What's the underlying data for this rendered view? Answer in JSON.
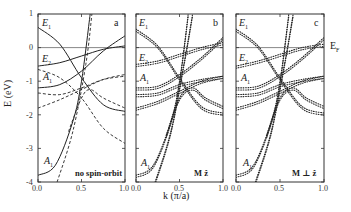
{
  "figure": {
    "y_axis_label": "E (eV)",
    "x_axis_label": "k (π/a)",
    "fermi_label": "E",
    "fermi_sub": "F",
    "y_ticks": [
      "1",
      "0",
      "-1",
      "-2",
      "-3",
      "-4"
    ],
    "x_ticks": [
      "0.0",
      "0.5",
      "1.0"
    ],
    "panels": [
      {
        "letter": "a",
        "note": "no spin-orbit",
        "labels": [
          {
            "t": "E",
            "s": "1"
          },
          {
            "t": "E",
            "s": "2"
          },
          {
            "t": "A",
            "s": "1"
          },
          {
            "t": "A",
            "s": "1"
          }
        ]
      },
      {
        "letter": "b",
        "note": "M  ẑ",
        "labels": [
          {
            "t": "E",
            "s": "1"
          },
          {
            "t": "E",
            "s": "2"
          },
          {
            "t": "A",
            "s": "1"
          },
          {
            "t": "A",
            "s": "1"
          }
        ]
      },
      {
        "letter": "c",
        "note": "M ⊥ ẑ",
        "labels": [
          {
            "t": "E",
            "s": "1"
          },
          {
            "t": "E",
            "s": "2"
          },
          {
            "t": "A",
            "s": "1"
          },
          {
            "t": "A",
            "s": "1"
          }
        ]
      }
    ]
  },
  "chart_data": [
    {
      "type": "line",
      "title": "a",
      "annotation": "no spin-orbit",
      "xlabel": "k (π/a)",
      "ylabel": "E (eV)",
      "xlim": [
        0.0,
        1.0
      ],
      "ylim": [
        -4,
        1
      ],
      "x_ticks": [
        0.0,
        0.5,
        1.0
      ],
      "y_ticks": [
        1,
        0,
        -1,
        -2,
        -3,
        -4
      ],
      "reference_line": {
        "y": 0,
        "label": "E_F"
      },
      "band_labels": [
        "E1",
        "E2",
        "A1",
        "A1"
      ],
      "series": [
        {
          "name": "E1 (solid)",
          "style": "solid",
          "x": [
            0,
            0.25,
            0.5,
            0.75,
            1.0
          ],
          "y": [
            0.6,
            0.1,
            -0.9,
            -1.7,
            -1.9
          ]
        },
        {
          "name": "E2 (solid)",
          "style": "solid",
          "x": [
            0,
            0.25,
            0.5,
            0.75,
            1.0
          ],
          "y": [
            -0.55,
            -0.45,
            -0.25,
            -0.05,
            0.05
          ]
        },
        {
          "name": "A1 upper (solid)",
          "style": "solid",
          "x": [
            0,
            0.25,
            0.5,
            0.75,
            1.0
          ],
          "y": [
            -1.2,
            -1.1,
            -0.7,
            -0.1,
            0.35
          ]
        },
        {
          "name": "A1 lower (solid)",
          "style": "solid",
          "x": [
            0,
            0.2,
            0.4,
            0.5,
            0.6
          ],
          "y": [
            -3.8,
            -3.5,
            -2.2,
            -1.0,
            1.0
          ]
        },
        {
          "name": "dashed 1",
          "style": "dashed",
          "x": [
            0,
            0.25,
            0.5,
            0.75,
            1.0
          ],
          "y": [
            -0.65,
            -0.9,
            -1.5,
            -2.4,
            -2.85
          ]
        },
        {
          "name": "dashed 2",
          "style": "dashed",
          "x": [
            0,
            0.25,
            0.5,
            0.75,
            1.0
          ],
          "y": [
            -1.35,
            -1.4,
            -1.2,
            -0.95,
            -0.85
          ]
        },
        {
          "name": "dashed 3",
          "style": "dashed",
          "x": [
            0,
            0.25,
            0.5,
            0.75,
            1.0
          ],
          "y": [
            -1.8,
            -1.55,
            -1.25,
            -0.95,
            -0.8
          ]
        },
        {
          "name": "dashed steep A",
          "style": "dashed",
          "x": [
            0.22,
            0.4,
            0.55,
            0.62
          ],
          "y": [
            -4.0,
            -2.5,
            -0.5,
            1.0
          ]
        },
        {
          "name": "dashed steep B",
          "style": "dashed",
          "x": [
            0.35,
            0.5,
            0.6,
            0.75,
            1.0
          ],
          "y": [
            -2.5,
            -1.5,
            -1.25,
            -1.5,
            -1.8
          ]
        }
      ]
    },
    {
      "type": "line",
      "title": "b",
      "annotation": "M ẑ",
      "xlabel": "k (π/a)",
      "ylabel": "E (eV)",
      "xlim": [
        0.0,
        1.0
      ],
      "ylim": [
        -4,
        1
      ],
      "x_ticks": [
        0.0,
        0.5,
        1.0
      ],
      "reference_line": {
        "y": 0,
        "label": "E_F"
      },
      "band_labels": [
        "E1",
        "E2",
        "A1",
        "A1"
      ],
      "series": [
        {
          "name": "E1 pair",
          "style": "dotted",
          "x": [
            0,
            0.25,
            0.5,
            0.75,
            1.0
          ],
          "y": [
            0.55,
            0.05,
            -0.9,
            -1.75,
            -1.95
          ]
        },
        {
          "name": "E2 pair",
          "style": "dotted",
          "x": [
            0,
            0.25,
            0.5,
            0.75,
            1.0
          ],
          "y": [
            -0.5,
            -0.4,
            -0.2,
            0.0,
            0.15
          ]
        },
        {
          "name": "A1 upper pair",
          "style": "dotted",
          "x": [
            0,
            0.25,
            0.5,
            0.75,
            1.0
          ],
          "y": [
            -1.2,
            -1.15,
            -0.8,
            -0.3,
            0.3
          ]
        },
        {
          "name": "A1 lower",
          "style": "dotted",
          "x": [
            0,
            0.2,
            0.4,
            0.5,
            0.6
          ],
          "y": [
            -3.8,
            -3.5,
            -2.2,
            -1.0,
            1.0
          ]
        },
        {
          "name": "band 5",
          "style": "dotted",
          "x": [
            0,
            0.25,
            0.5,
            0.75,
            1.0
          ],
          "y": [
            -1.4,
            -1.35,
            -1.1,
            -0.95,
            -0.85
          ]
        },
        {
          "name": "band 6",
          "style": "dotted",
          "x": [
            0,
            0.25,
            0.5,
            0.75,
            1.0
          ],
          "y": [
            -1.8,
            -1.6,
            -1.3,
            -1.0,
            -0.85
          ]
        },
        {
          "name": "steep 2",
          "style": "dotted",
          "x": [
            0.22,
            0.4,
            0.55,
            0.65
          ],
          "y": [
            -4.0,
            -2.5,
            -0.5,
            1.0
          ]
        },
        {
          "name": "band 8",
          "style": "dotted",
          "x": [
            0.35,
            0.5,
            0.65,
            0.8,
            1.0
          ],
          "y": [
            -2.6,
            -1.5,
            -1.2,
            -1.5,
            -1.75
          ]
        }
      ]
    },
    {
      "type": "line",
      "title": "c",
      "annotation": "M ⊥ ẑ",
      "xlabel": "k (π/a)",
      "ylabel": "E (eV)",
      "xlim": [
        0.0,
        1.0
      ],
      "ylim": [
        -4,
        1
      ],
      "x_ticks": [
        0.0,
        0.5,
        1.0
      ],
      "reference_line": {
        "y": 0,
        "label": "E_F"
      },
      "band_labels": [
        "E1",
        "E2",
        "A1",
        "A1"
      ],
      "series": [
        {
          "name": "E1",
          "style": "dotted",
          "x": [
            0,
            0.25,
            0.5,
            0.75,
            1.0
          ],
          "y": [
            0.55,
            0.05,
            -0.9,
            -1.75,
            -1.95
          ]
        },
        {
          "name": "E2",
          "style": "dotted",
          "x": [
            0,
            0.25,
            0.5,
            0.75,
            1.0
          ],
          "y": [
            -0.55,
            -0.4,
            -0.2,
            0.0,
            0.1
          ]
        },
        {
          "name": "A1 upper",
          "style": "dotted",
          "x": [
            0,
            0.25,
            0.5,
            0.75,
            1.0
          ],
          "y": [
            -1.2,
            -1.15,
            -0.8,
            -0.3,
            0.3
          ]
        },
        {
          "name": "A1 lower",
          "style": "dotted",
          "x": [
            0,
            0.2,
            0.4,
            0.5,
            0.6
          ],
          "y": [
            -3.8,
            -3.5,
            -2.2,
            -1.0,
            1.0
          ]
        },
        {
          "name": "band 5",
          "style": "dotted",
          "x": [
            0,
            0.25,
            0.5,
            0.75,
            1.0
          ],
          "y": [
            -1.4,
            -1.35,
            -1.1,
            -0.95,
            -0.85
          ]
        },
        {
          "name": "band 6",
          "style": "dotted",
          "x": [
            0,
            0.25,
            0.5,
            0.75,
            1.0
          ],
          "y": [
            -1.8,
            -1.6,
            -1.3,
            -1.0,
            -0.85
          ]
        },
        {
          "name": "steep 2",
          "style": "dotted",
          "x": [
            0.22,
            0.4,
            0.55,
            0.65
          ],
          "y": [
            -4.0,
            -2.5,
            -0.5,
            1.0
          ]
        },
        {
          "name": "band 8",
          "style": "dotted",
          "x": [
            0.35,
            0.5,
            0.65,
            0.8,
            1.0
          ],
          "y": [
            -2.6,
            -1.5,
            -1.2,
            -1.5,
            -1.75
          ]
        }
      ]
    }
  ]
}
